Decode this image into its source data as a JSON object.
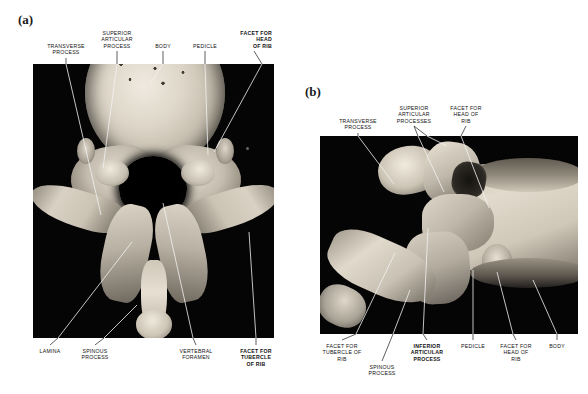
{
  "figure": {
    "width": 588,
    "height": 394,
    "background": "#ffffff"
  },
  "panels": [
    {
      "id": "a",
      "letter": "(a)",
      "view": "superior view",
      "photo": {
        "x": 33,
        "y": 64,
        "w": 241,
        "h": 274,
        "background": "#050505"
      },
      "labels": [
        {
          "key": "transverse-process",
          "text": "TRANSVERSE\nPROCESS",
          "x": 66,
          "y": 43,
          "align": "c",
          "bold": false
        },
        {
          "key": "superior-articular-process",
          "text": "SUPERIOR\nARTICULAR\nPROCESS",
          "x": 117,
          "y": 30,
          "align": "c",
          "bold": false
        },
        {
          "key": "body",
          "text": "BODY",
          "x": 163,
          "y": 43,
          "align": "c",
          "bold": false
        },
        {
          "key": "pedicle",
          "text": "PEDICLE",
          "x": 205,
          "y": 43,
          "align": "c",
          "bold": false
        },
        {
          "key": "facet-head-of-rib",
          "text": "FACET FOR\nHEAD\nOF RIB",
          "x": 272,
          "y": 30,
          "align": "r",
          "bold": true
        },
        {
          "key": "lamina",
          "text": "LAMINA",
          "x": 50,
          "y": 348,
          "align": "c",
          "bold": false
        },
        {
          "key": "spinous-process",
          "text": "SPINOUS\nPROCESS",
          "x": 95,
          "y": 348,
          "align": "c",
          "bold": false
        },
        {
          "key": "vertebral-foramen",
          "text": "VERTEBRAL\nFORAMEN",
          "x": 196,
          "y": 348,
          "align": "c",
          "bold": false
        },
        {
          "key": "facet-tubercle-of-rib",
          "text": "FACET FOR\nTUBERCLE\nOF RIB",
          "x": 256,
          "y": 348,
          "align": "c",
          "bold": true
        }
      ],
      "leaders": [
        {
          "key": "transverse-process",
          "points": "66,58 66,64",
          "tone": "dark"
        },
        {
          "key": "transverse-process-in",
          "points": "66,64 101,215",
          "tone": "light"
        },
        {
          "key": "superior-articular-process",
          "points": "117,51 117,64",
          "tone": "dark"
        },
        {
          "key": "superior-articular-process-in",
          "points": "117,64 103,168",
          "tone": "light"
        },
        {
          "key": "body",
          "points": "163,51 163,64",
          "tone": "dark"
        },
        {
          "key": "body-in",
          "points": "163,64 150,84",
          "tone": "light"
        },
        {
          "key": "pedicle",
          "points": "205,51 205,64",
          "tone": "dark"
        },
        {
          "key": "pedicle-in",
          "points": "205,64 208,155",
          "tone": "light"
        },
        {
          "key": "facet-head-of-rib",
          "points": "254,51 262,64",
          "tone": "dark"
        },
        {
          "key": "facet-head-of-rib-in",
          "points": "262,64 214,152",
          "tone": "light"
        },
        {
          "key": "lamina",
          "points": "50,345 58,338",
          "tone": "dark"
        },
        {
          "key": "lamina-in",
          "points": "58,338 132,242",
          "tone": "light"
        },
        {
          "key": "spinous-process",
          "points": "95,345 104,338",
          "tone": "dark"
        },
        {
          "key": "spinous-process-in",
          "points": "104,338 137,305",
          "tone": "light"
        },
        {
          "key": "vertebral-foramen",
          "points": "196,345 193,338",
          "tone": "dark"
        },
        {
          "key": "vertebral-foramen-in",
          "points": "193,338 163,203",
          "tone": "light"
        },
        {
          "key": "facet-tubercle-of-rib",
          "points": "256,345 256,338",
          "tone": "dark"
        },
        {
          "key": "facet-tubercle-of-rib-in",
          "points": "256,338 249,232",
          "tone": "light"
        }
      ]
    },
    {
      "id": "b",
      "letter": "(b)",
      "view": "lateral view",
      "photo": {
        "x": 320,
        "y": 136,
        "w": 258,
        "h": 198,
        "background": "#050505"
      },
      "labels": [
        {
          "key": "transverse-process",
          "text": "TRANSVERSE\nPROCESS",
          "x": 358,
          "y": 118,
          "align": "c",
          "bold": false
        },
        {
          "key": "superior-articular-processes",
          "text": "SUPERIOR\nARTICULAR\nPROCESSES",
          "x": 414,
          "y": 105,
          "align": "c",
          "bold": false
        },
        {
          "key": "facet-head-of-rib",
          "text": "FACET FOR\nHEAD OF\nRIB",
          "x": 466,
          "y": 105,
          "align": "c",
          "bold": false
        },
        {
          "key": "facet-tubercle-of-rib",
          "text": "FACET FOR\nTUBERCLE OF\nRIB",
          "x": 342,
          "y": 343,
          "align": "c",
          "bold": false
        },
        {
          "key": "spinous-process",
          "text": "SPINOUS\nPROCESS",
          "x": 382,
          "y": 364,
          "align": "c",
          "bold": false
        },
        {
          "key": "inferior-articular-process",
          "text": "INFERIOR\nARTICULAR\nPROCESS",
          "x": 427,
          "y": 343,
          "align": "c",
          "bold": true
        },
        {
          "key": "pedicle",
          "text": "PEDICLE",
          "x": 473,
          "y": 343,
          "align": "c",
          "bold": false
        },
        {
          "key": "facet-head-of-rib-lower",
          "text": "FACET FOR\nHEAD OF\nRIB",
          "x": 516,
          "y": 343,
          "align": "c",
          "bold": false
        },
        {
          "key": "body",
          "text": "BODY",
          "x": 557,
          "y": 343,
          "align": "c",
          "bold": false
        }
      ],
      "leaders": [
        {
          "key": "transverse-process",
          "points": "358,133 358,136",
          "tone": "dark"
        },
        {
          "key": "transverse-process-in",
          "points": "358,136 394,184",
          "tone": "light"
        },
        {
          "key": "superior-articular-processes-1",
          "points": "414,126 418,136",
          "tone": "dark"
        },
        {
          "key": "superior-articular-processes-1in",
          "points": "418,136 444,192",
          "tone": "light"
        },
        {
          "key": "superior-articular-processes-2",
          "points": "414,126 427,136",
          "tone": "dark"
        },
        {
          "key": "superior-articular-processes-2in",
          "points": "427,136 447,146",
          "tone": "light"
        },
        {
          "key": "facet-head-of-rib",
          "points": "466,126 461,136",
          "tone": "dark"
        },
        {
          "key": "facet-head-of-rib-in",
          "points": "461,136 489,208",
          "tone": "light"
        },
        {
          "key": "facet-tubercle-of-rib",
          "points": "342,340 356,334",
          "tone": "dark"
        },
        {
          "key": "facet-tubercle-of-rib-in",
          "points": "356,334 395,253",
          "tone": "light"
        },
        {
          "key": "spinous-process",
          "points": "382,361 393,334",
          "tone": "dark"
        },
        {
          "key": "spinous-process-in",
          "points": "393,334 410,290",
          "tone": "light"
        },
        {
          "key": "inferior-articular-process",
          "points": "427,340 423,334",
          "tone": "dark"
        },
        {
          "key": "inferior-articular-process-in",
          "points": "423,334 428,228",
          "tone": "light"
        },
        {
          "key": "pedicle",
          "points": "473,340 473,334",
          "tone": "dark"
        },
        {
          "key": "pedicle-in",
          "points": "473,334 473,270",
          "tone": "light"
        },
        {
          "key": "facet-head-of-rib-lower",
          "points": "516,340 513,334",
          "tone": "dark"
        },
        {
          "key": "facet-head-of-rib-lower-in",
          "points": "513,334 497,272",
          "tone": "light"
        },
        {
          "key": "body",
          "points": "557,340 557,334",
          "tone": "dark"
        },
        {
          "key": "body-in",
          "points": "557,334 533,280",
          "tone": "light"
        }
      ]
    }
  ]
}
